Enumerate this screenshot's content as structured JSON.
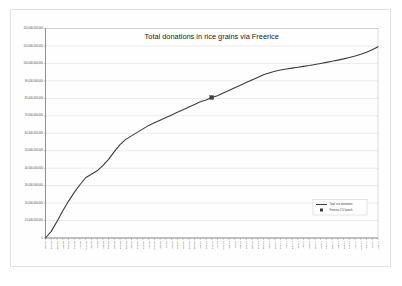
{
  "chart_data": {
    "type": "line",
    "title": "Total donations in rice grains via Freerice",
    "xlabel": "",
    "ylabel": "",
    "grid": true,
    "legend_position": "inside-bottom-right",
    "ylim": [
      0,
      120000000000
    ],
    "y_ticks": [
      0,
      10000000000,
      20000000000,
      30000000000,
      40000000000,
      50000000000,
      60000000000,
      70000000000,
      80000000000,
      90000000000,
      100000000000,
      110000000000,
      120000000000
    ],
    "y_tick_labels": [
      "0",
      "10,000,000,000",
      "20,000,000,000",
      "30,000,000,000",
      "40,000,000,000",
      "50,000,000,000",
      "60,000,000,000",
      "70,000,000,000",
      "80,000,000,000",
      "90,000,000,000",
      "100,000,000,000",
      "110,000,000,000",
      "120,000,000,000"
    ],
    "categories": [
      "Oct-07",
      "Nov-07",
      "Dec-07",
      "Jan-08",
      "Feb-08",
      "Mar-08",
      "Apr-08",
      "May-08",
      "Jun-08",
      "Jul-08",
      "Aug-08",
      "Sep-08",
      "Oct-08",
      "Nov-08",
      "Dec-08",
      "Jan-09",
      "Feb-09",
      "Mar-09",
      "Apr-09",
      "May-09",
      "Jun-09",
      "Jul-09",
      "Aug-09",
      "Sep-09",
      "Oct-09",
      "Nov-09",
      "Dec-09",
      "Jan-10",
      "Feb-10",
      "Mar-10",
      "Apr-10",
      "May-10",
      "Jun-10",
      "Jul-10",
      "Aug-10",
      "Sep-10",
      "Oct-10",
      "Nov-10",
      "Dec-10",
      "Jan-11",
      "Feb-11",
      "Mar-11",
      "Apr-11",
      "May-11",
      "Jun-11",
      "Jul-11",
      "Aug-11",
      "Sep-11",
      "Oct-11",
      "Nov-11",
      "Dec-11",
      "Jan-12",
      "Feb-12",
      "Mar-12",
      "Apr-12",
      "May-12",
      "Jun-12",
      "Jul-12",
      "Aug-12"
    ],
    "series": [
      {
        "name": "Total rice donations",
        "values": [
          0,
          3800000000,
          9500000000,
          15500000000,
          21000000000,
          26000000000,
          30500000000,
          34500000000,
          36500000000,
          38500000000,
          41500000000,
          45000000000,
          49500000000,
          53500000000,
          56500000000,
          58500000000,
          60500000000,
          62500000000,
          64500000000,
          66000000000,
          67500000000,
          69000000000,
          70500000000,
          72000000000,
          73500000000,
          75000000000,
          76500000000,
          78000000000,
          79000000000,
          80500000000,
          81500000000,
          83000000000,
          84500000000,
          86000000000,
          87500000000,
          89000000000,
          90500000000,
          92000000000,
          93500000000,
          94500000000,
          95500000000,
          96200000000,
          96800000000,
          97300000000,
          97800000000,
          98300000000,
          98800000000,
          99400000000,
          100000000000,
          100600000000,
          101200000000,
          101900000000,
          102600000000,
          103400000000,
          104200000000,
          105200000000,
          106400000000,
          107800000000,
          109500000000
        ]
      }
    ],
    "annotations": [
      {
        "name": "Freerice 2.0 launch",
        "x_index": 29,
        "y": 80500000000,
        "marker": "square"
      }
    ],
    "legend": [
      {
        "label": "Total rice donations",
        "swatch": "line"
      },
      {
        "label": "Freerice 2.0 launch",
        "swatch": "square-marker"
      }
    ],
    "colors": {
      "series_line": "#3c3c3c",
      "marker": "#3f3f3f",
      "grid": "#d9d9d9",
      "axis": "#6e6e6e",
      "title": "#1a1a1a",
      "background": "#ffffff"
    }
  }
}
